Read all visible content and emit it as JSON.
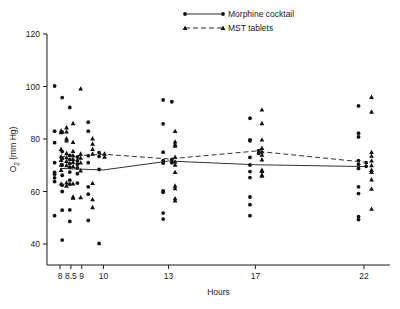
{
  "figure": {
    "caption_bottom": "",
    "axis_color": "#1a1a1a",
    "marker_color": "#111111"
  },
  "legend": {
    "position": "top-center",
    "entries": [
      {
        "label": "Morphine cocktail",
        "marker": "circle",
        "line": "solid"
      },
      {
        "label": "MST tablets",
        "marker": "triangle",
        "line": "dashed"
      }
    ]
  },
  "chart_data": {
    "type": "scatter",
    "title": "",
    "xlabel": "Hours",
    "ylabel": "O2 (mm Hg)",
    "ylabel_display": "O",
    "ylabel_sub": "2",
    "ylabel_rest": " (mm Hg)",
    "xlim": [
      7.4,
      23.2
    ],
    "ylim": [
      32,
      120
    ],
    "yticks": [
      40,
      60,
      80,
      100,
      120
    ],
    "ytick_labels": [
      "40",
      "60",
      "80",
      "100",
      "120"
    ],
    "xticks": [
      8,
      8.5,
      9,
      10,
      13,
      17,
      22
    ],
    "xtick_labels": [
      "8",
      "8.5",
      "9",
      "10",
      "13",
      "17",
      "22"
    ],
    "grid": false,
    "series": [
      {
        "name": "Morphine cocktail",
        "marker": "circle",
        "line": "solid",
        "mean_x": [
          8,
          10,
          13,
          17,
          22
        ],
        "mean_y": [
          68.8,
          68.2,
          71.6,
          70.2,
          69.5
        ],
        "points": [
          [
            7.75,
            100.2
          ],
          [
            7.75,
            83.0
          ],
          [
            7.75,
            78.6
          ],
          [
            7.75,
            71.0
          ],
          [
            7.75,
            67.3
          ],
          [
            7.75,
            66.6
          ],
          [
            7.75,
            65.2
          ],
          [
            7.75,
            63.8
          ],
          [
            7.75,
            50.8
          ],
          [
            8.1,
            95.8
          ],
          [
            8.1,
            82.6
          ],
          [
            8.1,
            75.2
          ],
          [
            8.1,
            72.6
          ],
          [
            8.1,
            70.1
          ],
          [
            8.1,
            66.2
          ],
          [
            8.1,
            62.4
          ],
          [
            8.1,
            60.0
          ],
          [
            8.1,
            52.9
          ],
          [
            8.1,
            41.5
          ],
          [
            8.45,
            92.0
          ],
          [
            8.45,
            73.8
          ],
          [
            8.45,
            72.2
          ],
          [
            8.45,
            70.6
          ],
          [
            8.45,
            69.2
          ],
          [
            8.45,
            67.4
          ],
          [
            8.45,
            64.3
          ],
          [
            8.45,
            62.8
          ],
          [
            8.45,
            53.0
          ],
          [
            8.45,
            48.6
          ],
          [
            8.8,
            73.1
          ],
          [
            8.8,
            71.7
          ],
          [
            8.8,
            70.4
          ],
          [
            8.8,
            69.0
          ],
          [
            8.8,
            66.8
          ],
          [
            8.8,
            63.2
          ],
          [
            9.3,
            86.4
          ],
          [
            9.3,
            83.0
          ],
          [
            9.3,
            73.6
          ],
          [
            9.3,
            71.0
          ],
          [
            9.3,
            61.8
          ],
          [
            9.3,
            59.0
          ],
          [
            9.3,
            49.0
          ],
          [
            9.8,
            74.8
          ],
          [
            9.8,
            73.4
          ],
          [
            9.8,
            68.4
          ],
          [
            9.8,
            40.2
          ],
          [
            12.75,
            94.9
          ],
          [
            12.75,
            85.8
          ],
          [
            12.75,
            75.0
          ],
          [
            12.75,
            71.8
          ],
          [
            12.75,
            70.8
          ],
          [
            12.75,
            60.2
          ],
          [
            12.75,
            59.7
          ],
          [
            12.75,
            51.8
          ],
          [
            12.75,
            49.5
          ],
          [
            13.15,
            94.2
          ],
          [
            13.15,
            72.2
          ],
          [
            13.15,
            71.0
          ],
          [
            16.75,
            87.9
          ],
          [
            16.75,
            79.7
          ],
          [
            16.75,
            79.3
          ],
          [
            16.75,
            73.0
          ],
          [
            16.75,
            70.1
          ],
          [
            16.75,
            67.6
          ],
          [
            16.75,
            65.3
          ],
          [
            16.75,
            57.9
          ],
          [
            16.75,
            55.0
          ],
          [
            16.75,
            50.8
          ],
          [
            17.15,
            75.6
          ],
          [
            17.15,
            74.5
          ],
          [
            21.75,
            92.6
          ],
          [
            21.75,
            82.2
          ],
          [
            21.75,
            80.8
          ],
          [
            21.75,
            71.8
          ],
          [
            21.75,
            70.4
          ],
          [
            21.75,
            68.8
          ],
          [
            21.75,
            61.8
          ],
          [
            21.75,
            59.2
          ],
          [
            21.75,
            50.4
          ],
          [
            21.75,
            49.3
          ],
          [
            22.1,
            71.0
          ],
          [
            22.1,
            69.6
          ]
        ]
      },
      {
        "name": "MST tablets",
        "marker": "triangle",
        "line": "dashed",
        "mean_x": [
          8,
          10,
          13,
          17,
          22
        ],
        "mean_y": [
          73.2,
          74.2,
          72.4,
          75.4,
          71.2
        ],
        "points": [
          [
            8.05,
            83.2
          ],
          [
            8.05,
            82.6
          ],
          [
            8.05,
            76.2
          ],
          [
            8.05,
            73.4
          ],
          [
            8.05,
            72.0
          ],
          [
            8.05,
            70.2
          ],
          [
            8.05,
            68.2
          ],
          [
            8.05,
            63.0
          ],
          [
            8.3,
            84.4
          ],
          [
            8.3,
            82.8
          ],
          [
            8.3,
            80.2
          ],
          [
            8.3,
            79.4
          ],
          [
            8.3,
            74.6
          ],
          [
            8.3,
            73.0
          ],
          [
            8.3,
            71.6
          ],
          [
            8.3,
            70.0
          ],
          [
            8.3,
            63.4
          ],
          [
            8.3,
            62.2
          ],
          [
            8.6,
            86.0
          ],
          [
            8.6,
            78.8
          ],
          [
            8.6,
            75.4
          ],
          [
            8.6,
            73.8
          ],
          [
            8.6,
            72.4
          ],
          [
            8.6,
            71.2
          ],
          [
            8.6,
            69.6
          ],
          [
            8.6,
            63.0
          ],
          [
            8.6,
            58.0
          ],
          [
            8.6,
            57.6
          ],
          [
            8.95,
            99.2
          ],
          [
            8.95,
            74.4
          ],
          [
            8.95,
            72.8
          ],
          [
            8.95,
            71.0
          ],
          [
            8.95,
            68.0
          ],
          [
            8.95,
            57.8
          ],
          [
            9.5,
            80.2
          ],
          [
            9.5,
            78.2
          ],
          [
            9.5,
            76.2
          ],
          [
            9.5,
            74.4
          ],
          [
            9.5,
            63.2
          ],
          [
            9.5,
            57.0
          ],
          [
            9.5,
            54.0
          ],
          [
            10.05,
            74.4
          ],
          [
            10.05,
            73.2
          ],
          [
            13.3,
            83.0
          ],
          [
            13.3,
            79.0
          ],
          [
            13.3,
            78.0
          ],
          [
            13.3,
            77.4
          ],
          [
            13.3,
            73.2
          ],
          [
            13.3,
            71.4
          ],
          [
            13.3,
            70.2
          ],
          [
            13.3,
            67.4
          ],
          [
            13.3,
            62.2
          ],
          [
            13.3,
            61.2
          ],
          [
            13.3,
            57.4
          ],
          [
            13.3,
            56.6
          ],
          [
            17.3,
            91.2
          ],
          [
            17.3,
            86.0
          ],
          [
            17.3,
            79.8
          ],
          [
            17.3,
            76.6
          ],
          [
            17.3,
            75.2
          ],
          [
            17.3,
            74.0
          ],
          [
            17.3,
            72.2
          ],
          [
            17.3,
            68.2
          ],
          [
            17.3,
            67.8
          ],
          [
            17.3,
            66.4
          ],
          [
            17.3,
            66.0
          ],
          [
            22.35,
            96.0
          ],
          [
            22.35,
            90.4
          ],
          [
            22.35,
            75.0
          ],
          [
            22.35,
            73.6
          ],
          [
            22.35,
            71.8
          ],
          [
            22.35,
            70.0
          ],
          [
            22.35,
            68.2
          ],
          [
            22.35,
            67.4
          ],
          [
            22.35,
            64.6
          ],
          [
            22.35,
            61.0
          ],
          [
            22.35,
            53.4
          ]
        ]
      }
    ]
  }
}
